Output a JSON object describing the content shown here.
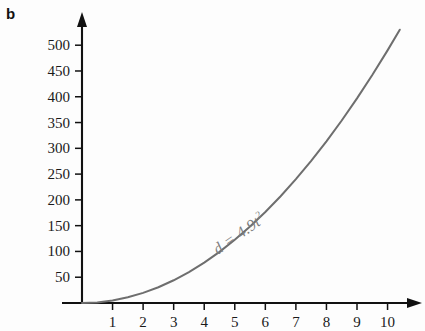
{
  "panel": {
    "label": "b"
  },
  "chart_data": {
    "type": "line",
    "title": "",
    "subtitle": "",
    "xlabel": "",
    "ylabel": "",
    "equation_display": "d = 4.9t",
    "equation_exponent": "2",
    "equation_plain": "d = 4.9t^2",
    "formula_coefficient": 4.9,
    "xlim": [
      0,
      10.8
    ],
    "ylim": [
      0,
      545
    ],
    "grid": false,
    "legend": null,
    "x_ticks": [
      1,
      2,
      3,
      4,
      5,
      6,
      7,
      8,
      9,
      10
    ],
    "x_tick_labels": [
      "1",
      "2",
      "3",
      "4",
      "5",
      "6",
      "7",
      "8",
      "9",
      "10"
    ],
    "y_ticks": [
      50,
      100,
      150,
      200,
      250,
      300,
      350,
      400,
      450,
      500
    ],
    "y_tick_labels": [
      "50",
      "100",
      "150",
      "200",
      "250",
      "300",
      "350",
      "400",
      "450",
      "500"
    ],
    "x": [
      0,
      0.5,
      1,
      1.5,
      2,
      2.5,
      3,
      3.5,
      4,
      4.5,
      5,
      5.5,
      6,
      6.5,
      7,
      7.5,
      8,
      8.5,
      9,
      9.5,
      10,
      10.4
    ],
    "values": [
      0,
      1.2,
      4.9,
      11,
      19.6,
      30.6,
      44.1,
      60,
      78.4,
      99.2,
      122.5,
      148.2,
      176.4,
      207.0,
      240.1,
      275.6,
      313.6,
      354.0,
      396.9,
      442.2,
      490,
      530.0
    ],
    "series": [
      {
        "name": "d = 4.9t^2",
        "color": "#6e6e6e",
        "values": [
          0,
          1.2,
          4.9,
          11,
          19.6,
          30.6,
          44.1,
          60,
          78.4,
          99.2,
          122.5,
          148.2,
          176.4,
          207.0,
          240.1,
          275.6,
          313.6,
          354.0,
          396.9,
          442.2,
          490,
          530.0
        ]
      }
    ],
    "annotations": [
      {
        "text": "d = 4.9t2",
        "rotation_deg": -35,
        "color": "#7c7c7c"
      }
    ],
    "colors": {
      "curve": "#6e6e6e",
      "axis": "#111111",
      "tick_text": "#1a1a1a",
      "annotation": "#7c7c7c",
      "background": "#fdfdfd"
    }
  }
}
